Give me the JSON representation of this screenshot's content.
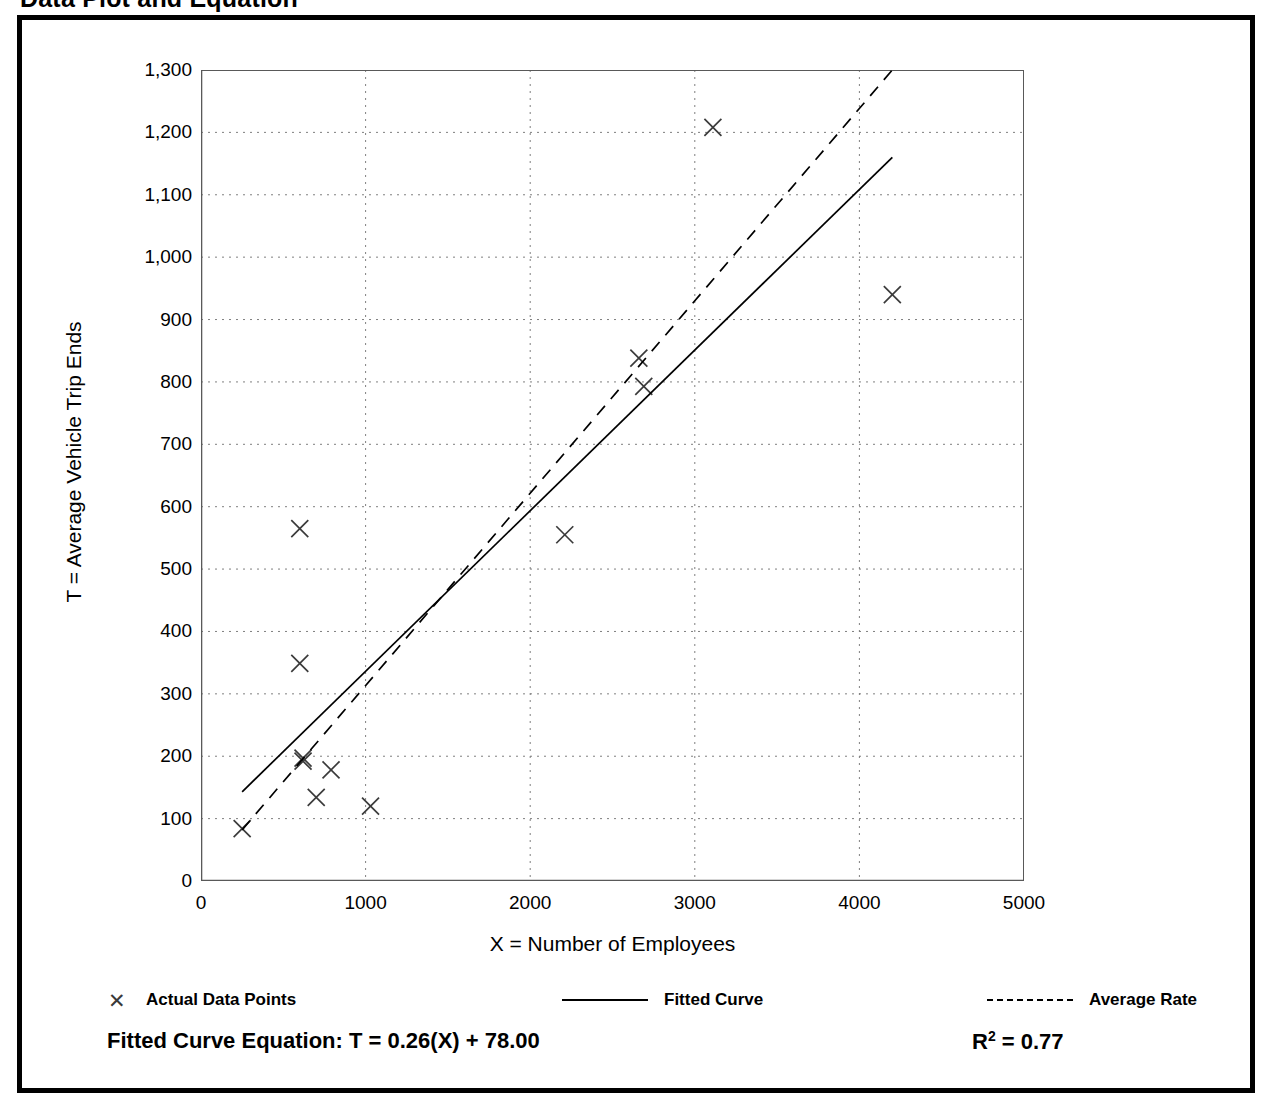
{
  "page_title": "Data Plot and Equation",
  "chart_data": {
    "type": "scatter",
    "title": "Data Plot and Equation",
    "xlabel": "X = Number of Employees",
    "ylabel": "T = Average Vehicle Trip Ends",
    "xlim": [
      0,
      5000
    ],
    "ylim": [
      0,
      1300
    ],
    "x_ticks": [
      0,
      1000,
      2000,
      3000,
      4000,
      5000
    ],
    "x_tick_labels": [
      "0",
      "1000",
      "2000",
      "3000",
      "4000",
      "5000"
    ],
    "x_minor_tick_interval": 500,
    "y_ticks": [
      0,
      100,
      200,
      300,
      400,
      500,
      600,
      700,
      800,
      900,
      1000,
      1100,
      1200,
      1300
    ],
    "y_tick_labels": [
      "0",
      "100",
      "200",
      "300",
      "400",
      "500",
      "600",
      "700",
      "800",
      "900",
      "1,000",
      "1,100",
      "1,200",
      "1,300"
    ],
    "y_minor_tick_interval": 50,
    "grid": "dotted-major-both-axes",
    "legend_position": "below-plot",
    "series": [
      {
        "name": "Actual Data Points",
        "type": "scatter",
        "marker": "x",
        "points": [
          {
            "x": 250,
            "y": 84
          },
          {
            "x": 600,
            "y": 565
          },
          {
            "x": 600,
            "y": 349
          },
          {
            "x": 620,
            "y": 197
          },
          {
            "x": 620,
            "y": 192
          },
          {
            "x": 700,
            "y": 134
          },
          {
            "x": 790,
            "y": 178
          },
          {
            "x": 1030,
            "y": 120
          },
          {
            "x": 2210,
            "y": 555
          },
          {
            "x": 2660,
            "y": 838
          },
          {
            "x": 2690,
            "y": 793
          },
          {
            "x": 3110,
            "y": 1208
          },
          {
            "x": 4200,
            "y": 940
          }
        ]
      },
      {
        "name": "Fitted Curve",
        "type": "line",
        "style": "solid",
        "equation": "T = 0.26(X) + 78.00",
        "slope": 0.26,
        "intercept": 78.0,
        "x_from": 250,
        "x_to": 4200,
        "y_from": 143,
        "y_to": 1160
      },
      {
        "name": "Average Rate",
        "type": "line",
        "style": "dashed",
        "slope": 0.328,
        "intercept": 0,
        "x_from": 250,
        "x_to": 4200,
        "y_from": 82,
        "y_to": 1300
      }
    ],
    "annotations": {
      "fitted_equation_label": "Fitted Curve Equation:  T = 0.26(X) + 78.00",
      "r_squared_label": "R",
      "r_squared_exponent": "2",
      "r_squared_value": " = 0.77"
    }
  },
  "legend": {
    "actual": {
      "label": "Actual Data Points",
      "marker": "✕"
    },
    "fitted": {
      "label": "Fitted Curve"
    },
    "average": {
      "label": "Average Rate"
    }
  },
  "colors": {
    "frame": "#000000",
    "axis": "#595959",
    "grid": "#7f7f7f",
    "marker": "#3a3a3a",
    "line": "#000000"
  }
}
